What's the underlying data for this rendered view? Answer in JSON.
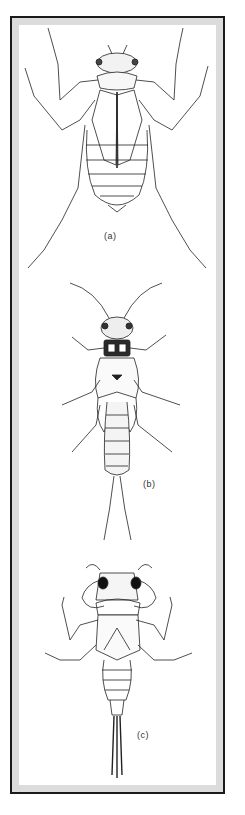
{
  "figure": {
    "panels": [
      {
        "id": "a",
        "label": "(a)",
        "subject": "insect nymph, ventral view"
      },
      {
        "id": "b",
        "label": "(b)",
        "subject": "stonefly nymph with two long cerci"
      },
      {
        "id": "c",
        "label": "(c)",
        "subject": "burrowing nymph with broad forelegs and hairy tail"
      }
    ],
    "colors": {
      "border": "#1a1a1a",
      "mat": "#dcdcdc",
      "background": "#ffffff",
      "ink": "#222222"
    }
  }
}
